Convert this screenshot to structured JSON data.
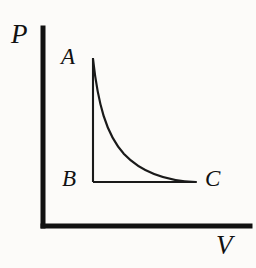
{
  "figure": {
    "background_color": "#fcfbf9",
    "ink_color": "#111111"
  },
  "axes": {
    "y_axis_label": "P",
    "x_axis_label": "V",
    "y_axis_name": "pressure-axis",
    "x_axis_name": "volume-axis",
    "origin": [
      43,
      226
    ],
    "y_axis_top": [
      43,
      28
    ],
    "x_axis_right": [
      250,
      226
    ]
  },
  "points": [
    {
      "id": "A",
      "label": "A",
      "x": 93,
      "y": 58
    },
    {
      "id": "B",
      "label": "B",
      "x": 93,
      "y": 182
    },
    {
      "id": "C",
      "label": "C",
      "x": 196,
      "y": 182
    }
  ],
  "paths": {
    "isotherm_A_to_C": "M 93 59 C 98 104, 106 134, 124 154 C 142 173, 166 181, 196 182",
    "line_A_to_B": "M 93 58 L 93 182",
    "line_B_to_C": "M 93 182 L 196 182",
    "y_axis": "M 43 28 L 43 226",
    "x_axis": "M 43 226 L 250 226"
  },
  "chart_data": {
    "type": "line",
    "title": "",
    "xlabel": "V",
    "ylabel": "P",
    "grid": false,
    "legend": null,
    "annotations": [
      "A",
      "B",
      "C"
    ],
    "series": [
      {
        "name": "isotherm A->C",
        "x": [
          0.0,
          0.08,
          0.18,
          0.3,
          0.45,
          0.62,
          0.8,
          1.0
        ],
        "y": [
          1.0,
          0.74,
          0.52,
          0.35,
          0.21,
          0.11,
          0.04,
          0.0
        ]
      },
      {
        "name": "isochoric A->B",
        "x": [
          0.0,
          0.0
        ],
        "y": [
          1.0,
          0.0
        ]
      },
      {
        "name": "isobaric B->C",
        "x": [
          0.0,
          1.0
        ],
        "y": [
          0.0,
          0.0
        ]
      }
    ],
    "xlim": [
      0,
      1
    ],
    "ylim": [
      0,
      1
    ]
  }
}
